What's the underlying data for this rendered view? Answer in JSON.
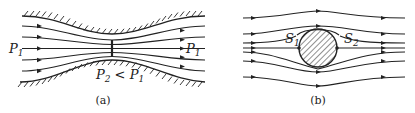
{
  "panels": [
    {
      "id": "a",
      "caption": "(a)",
      "description": "Flow through a converging-diverging channel (streamlines narrow at throat)",
      "labels": {
        "inlet_pressure": {
          "symbol": "P",
          "subscript": "1"
        },
        "outlet_pressure": {
          "symbol": "P",
          "subscript": "1"
        },
        "throat_pressure": {
          "symbol": "P",
          "subscript": "2",
          "relation": " < ",
          "compare_symbol": "P",
          "compare_subscript": "1"
        }
      },
      "streamline_count": 5
    },
    {
      "id": "b",
      "caption": "(b)",
      "description": "Uniform flow past a circular cylinder with stagnation points",
      "labels": {
        "front_stagnation": {
          "symbol": "S",
          "subscript": "1"
        },
        "rear_stagnation": {
          "symbol": "S",
          "subscript": "2"
        }
      },
      "streamline_count": 8
    }
  ],
  "colors": {
    "ink": "#222222",
    "background": "#ffffff"
  }
}
